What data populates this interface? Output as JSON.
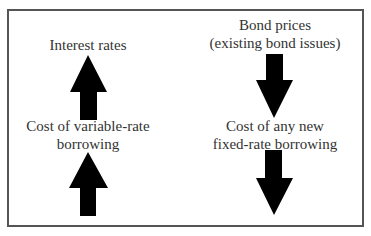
{
  "diagram": {
    "left_column": {
      "top_label": "Interest rates",
      "top_direction": "up",
      "bottom_label_line1": "Cost of variable-rate",
      "bottom_label_line2": "borrowing",
      "bottom_direction": "up"
    },
    "right_column": {
      "top_label_line1": "Bond prices",
      "top_label_line2": "(existing bond issues)",
      "top_direction": "down",
      "bottom_label_line1": "Cost of any new",
      "bottom_label_line2": "fixed-rate borrowing",
      "bottom_direction": "down"
    },
    "colors": {
      "arrow": "#000000",
      "border": "#555555",
      "text": "#333333",
      "background": "#ffffff"
    }
  }
}
